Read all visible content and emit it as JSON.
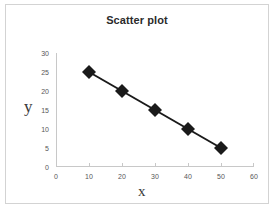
{
  "chart_data": {
    "type": "scatter",
    "title": "Scatter plot",
    "xlabel": "x",
    "ylabel": "y",
    "x": [
      10,
      20,
      30,
      40,
      50
    ],
    "values": [
      25,
      20,
      15,
      10,
      5
    ],
    "series": [
      {
        "name": "Series 1",
        "x": [
          10,
          20,
          30,
          40,
          50
        ],
        "values": [
          25,
          20,
          15,
          10,
          5
        ]
      }
    ],
    "xlim": [
      0,
      60
    ],
    "ylim": [
      0,
      30
    ],
    "xticks": [
      0,
      10,
      20,
      30,
      40,
      50,
      60
    ],
    "yticks": [
      0,
      5,
      10,
      15,
      20,
      25,
      30
    ],
    "xtick_labels": [
      "0",
      "10",
      "20",
      "30",
      "40",
      "50",
      "60"
    ],
    "ytick_labels": [
      "0",
      "5",
      "10",
      "15",
      "20",
      "25",
      "30"
    ],
    "grid": false,
    "legend": false,
    "marker": "diamond",
    "marker_color": "#1a1a1a",
    "line_color": "#1a1a1a",
    "axis_color": "#c8c8c8",
    "title_color": "#2b2b2b",
    "border_color": "#d3d3d3",
    "connected": true
  }
}
